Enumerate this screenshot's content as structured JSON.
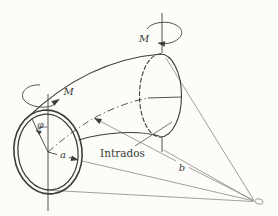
{
  "figure": {
    "labels": {
      "moment_left": "M",
      "moment_right": "M",
      "angle_phi": "φ",
      "radius_a": "a",
      "bend_radius_b": "b",
      "intrados": "Intrados"
    },
    "colors": {
      "background": "#fcfcf9",
      "primary_line": "#3e3e3e",
      "construction_line": "#8f8f8f",
      "text": "#3a3a3a"
    }
  }
}
